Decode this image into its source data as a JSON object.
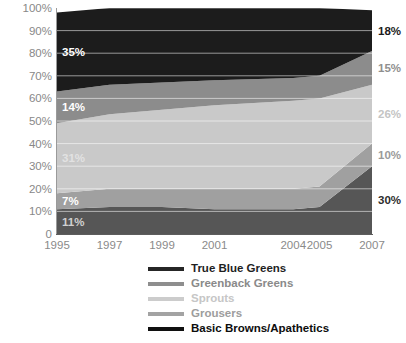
{
  "chart_data": {
    "type": "area",
    "stacked": true,
    "normalized_percent": true,
    "title": "",
    "subtitle": "",
    "xlabel": "",
    "ylabel": "",
    "x": [
      1995,
      1997,
      1999,
      2001,
      2004,
      2005,
      2007
    ],
    "xtick_labels": [
      "1995",
      "1997",
      "1999",
      "2001",
      "2004",
      "2005",
      "2007"
    ],
    "ytick_labels": [
      "100%",
      "90%",
      "80%",
      "70%",
      "60%",
      "50%",
      "40%",
      "30%",
      "20%",
      "10%",
      "0"
    ],
    "ylim": [
      0,
      100
    ],
    "grid": "horizontal",
    "legend_position": "bottom",
    "stack_order_bottom_to_top": [
      "Basic Browns/Apathetics",
      "Grousers",
      "Sprouts",
      "Greenback Greens",
      "True Blue Greens"
    ],
    "series": [
      {
        "name": "True Blue Greens",
        "color": "#1c1c1c",
        "values": [
          35,
          34,
          33,
          32,
          31,
          30,
          18
        ]
      },
      {
        "name": "Greenback Greens",
        "color": "#8c8c8c",
        "values": [
          14,
          13,
          12,
          11,
          10,
          10,
          15
        ]
      },
      {
        "name": "Sprouts",
        "color": "#c9c9c9",
        "values": [
          31,
          33,
          35,
          37,
          39,
          39,
          26
        ]
      },
      {
        "name": "Grousers",
        "color": "#a0a0a0",
        "values": [
          7,
          8,
          8,
          9,
          9,
          9,
          10
        ]
      },
      {
        "name": "Basic Browns/Apathetics",
        "color": "#565656",
        "values": [
          11,
          12,
          12,
          11,
          11,
          12,
          30
        ]
      }
    ],
    "left_annotations": [
      {
        "text": "35%",
        "series": "True Blue Greens",
        "value": 35,
        "color": "#ffffff"
      },
      {
        "text": "14%",
        "series": "Greenback Greens",
        "value": 14,
        "color": "#ffffff"
      },
      {
        "text": "31%",
        "series": "Sprouts",
        "value": 31,
        "color": "#e2e2e2"
      },
      {
        "text": "7%",
        "series": "Grousers",
        "value": 7,
        "color": "#ffffff"
      },
      {
        "text": "11%",
        "series": "Basic Browns/Apathetics",
        "value": 11,
        "color": "#d0d0d0"
      }
    ],
    "right_annotations": [
      {
        "text": "18%",
        "series": "True Blue Greens",
        "value": 18,
        "color": "#1c1c1c"
      },
      {
        "text": "15%",
        "series": "Greenback Greens",
        "value": 15,
        "color": "#8f8f8f"
      },
      {
        "text": "26%",
        "series": "Sprouts",
        "value": 26,
        "color": "#c4c4c4"
      },
      {
        "text": "10%",
        "series": "Grousers",
        "value": 10,
        "color": "#9a9a9a"
      },
      {
        "text": "30%",
        "series": "Basic Browns/Apathetics",
        "value": 30,
        "color": "#2e2e2e"
      }
    ]
  },
  "legend": {
    "items": [
      {
        "label": "True Blue Greens",
        "swatch": "#262626",
        "text_color": "#1f1f1f"
      },
      {
        "label": "Greenback Greens",
        "swatch": "#8e8e8e",
        "text_color": "#8a8a8a"
      },
      {
        "label": "Sprouts",
        "swatch": "#cccccc",
        "text_color": "#c6c6c6"
      },
      {
        "label": "Grousers",
        "swatch": "#a3a3a3",
        "text_color": "#9d9d9d"
      },
      {
        "label": "Basic Browns/Apathetics",
        "swatch": "#101010",
        "text_color": "#0d0d0d"
      }
    ]
  },
  "axes": {
    "y_ticks": [
      "100%",
      "90%",
      "80%",
      "70%",
      "60%",
      "50%",
      "40%",
      "30%",
      "20%",
      "10%",
      "0"
    ],
    "x_ticks": [
      "1995",
      "1997",
      "1999",
      "2001",
      "2004",
      "2005",
      "2007"
    ]
  }
}
